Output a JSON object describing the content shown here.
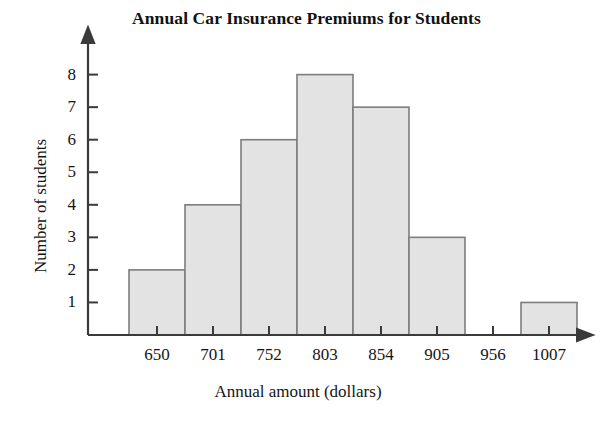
{
  "chart_data": {
    "type": "bar",
    "title": "Annual Car Insurance Premiums for Students",
    "xlabel": "Annual amount (dollars)",
    "ylabel": "Number of students",
    "categories": [
      "650",
      "701",
      "752",
      "803",
      "854",
      "905",
      "956",
      "1007"
    ],
    "values": [
      2,
      4,
      6,
      8,
      7,
      3,
      0,
      1
    ],
    "ytick_labels": [
      "1",
      "2",
      "3",
      "4",
      "5",
      "6",
      "7",
      "8"
    ],
    "ytick_values": [
      1,
      2,
      3,
      4,
      5,
      6,
      7,
      8
    ],
    "ylim": [
      0,
      8.6
    ],
    "grid": false,
    "legend": null,
    "bar_fill_color": "#e3e3e3",
    "bar_edge_color": "#7d7d7d",
    "axis_color": "#3a3a3a",
    "text_color": "#151515",
    "background_color": "#ffffff",
    "axis_arrows": true,
    "bin_width_label": "51"
  },
  "figure": {
    "caption_title": "Annual Car Insurance Premiums for Students"
  }
}
